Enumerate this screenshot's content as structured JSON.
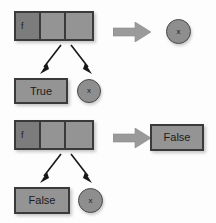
{
  "diagram": {
    "background_color": "#fdfdfd",
    "colors": {
      "cell_light": "#949494",
      "cell_dark": "#7c7c7c",
      "border": "#3a3a3a",
      "arrow_block": "#9a9a9a",
      "arrow_thin": "#171717",
      "text": "#1c1c1c"
    },
    "rows": [
      {
        "id": "row-1",
        "cell_box": {
          "name": "closure-cell-box-top",
          "cells": [
            {
              "label": "f",
              "shade": "dark"
            },
            {
              "label": "",
              "shade": "light"
            },
            {
              "label": "",
              "shade": "light"
            }
          ]
        },
        "block_arrow": {
          "name": "evaluates-to-arrow-top",
          "glyph": "right-arrow"
        },
        "result": {
          "kind": "circle",
          "label": "x",
          "name": "result-node-x-top"
        },
        "children": [
          {
            "kind": "box",
            "label": "True",
            "name": "child-value-true"
          },
          {
            "kind": "circle",
            "label": "x",
            "name": "child-node-x-top"
          }
        ],
        "child_arrows": [
          {
            "name": "branch-arrow-left-top",
            "direction": "down-left"
          },
          {
            "name": "branch-arrow-right-top",
            "direction": "down-right"
          }
        ]
      },
      {
        "id": "row-2",
        "cell_box": {
          "name": "closure-cell-box-bottom",
          "cells": [
            {
              "label": "f",
              "shade": "dark"
            },
            {
              "label": "",
              "shade": "light"
            },
            {
              "label": "",
              "shade": "light"
            }
          ]
        },
        "block_arrow": {
          "name": "evaluates-to-arrow-bottom",
          "glyph": "right-arrow"
        },
        "result": {
          "kind": "box",
          "label": "False",
          "name": "result-value-false"
        },
        "children": [
          {
            "kind": "box",
            "label": "False",
            "name": "child-value-false"
          },
          {
            "kind": "circle",
            "label": "x",
            "name": "child-node-x-bottom"
          }
        ],
        "child_arrows": [
          {
            "name": "branch-arrow-left-bottom",
            "direction": "down-left"
          },
          {
            "name": "branch-arrow-right-bottom",
            "direction": "down-right"
          }
        ]
      }
    ]
  }
}
